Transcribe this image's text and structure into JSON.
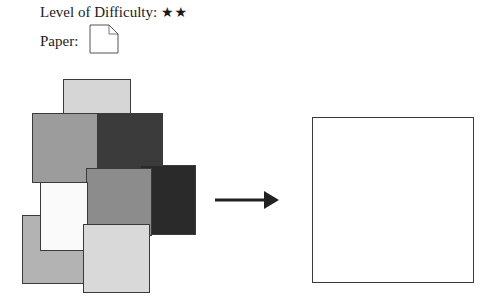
{
  "header": {
    "difficulty_label": "Level of Difficulty:",
    "difficulty_stars": "★★",
    "difficulty_level": 2,
    "paper_label": "Paper:"
  },
  "icons": {
    "paper": "paper-sheet-folded-corner-icon",
    "arrow": "arrow-right-icon"
  },
  "squares": [
    {
      "name": "square-bottom-left-gray",
      "color": "#b3b3b3"
    },
    {
      "name": "square-top-light",
      "color": "#d6d6d6"
    },
    {
      "name": "square-mid-left-gray",
      "color": "#9c9c9c"
    },
    {
      "name": "square-dark",
      "color": "#3b3b3b"
    },
    {
      "name": "square-darkest-right",
      "color": "#2a2a2a"
    },
    {
      "name": "square-center-gray",
      "color": "#8c8c8c"
    },
    {
      "name": "square-white",
      "color": "#fafafa"
    },
    {
      "name": "square-bottom-light",
      "color": "#d9d9d9"
    }
  ],
  "result": {
    "name": "single-square-paper",
    "color": "#ffffff"
  }
}
